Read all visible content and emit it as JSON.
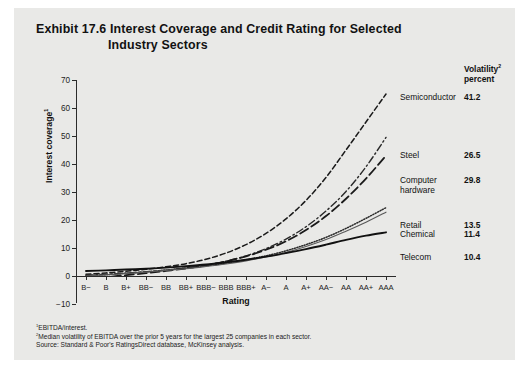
{
  "exhibit": {
    "title_line1": "Exhibit 17.6 Interest Coverage and Credit Rating for Selected",
    "title_line2": "Industry Sectors",
    "panel_color": "#e9e9e7"
  },
  "volatility_header": {
    "line1": "Volatility",
    "line1_sup": "2",
    "line2": "percent"
  },
  "footnotes": {
    "note1_sup": "1",
    "note1": "EBITDA/interest.",
    "note2_sup": "2",
    "note2": "Median volatility of EBITDA over the prior 5 years for the largest 25 companies in each sector.",
    "source": "Source: Standard & Poor's RatingsDirect database, McKinsey analysis."
  },
  "chart_data": {
    "type": "line",
    "title": "Exhibit 17.6 Interest Coverage and Credit Rating for Selected Industry Sectors",
    "xlabel": "Rating",
    "ylabel": "Interest coverage",
    "ylabel_sup": "1",
    "grid": false,
    "legend_position": "right-end-labels",
    "categories": [
      "B-",
      "B",
      "B+",
      "BB-",
      "BB",
      "BB+",
      "BBB-",
      "BBB",
      "BBB+",
      "A-",
      "A",
      "A+",
      "AA-",
      "AA",
      "AA+",
      "AAA"
    ],
    "ylim": [
      -10,
      70
    ],
    "yticks": [
      70,
      60,
      50,
      40,
      30,
      20,
      10,
      0,
      -10
    ],
    "series": [
      {
        "name": "Semiconductor",
        "volatility_percent": "41.2",
        "style": "dashed",
        "color": "#1a1a1a",
        "width": 1.5,
        "dash": "5,3",
        "values": [
          0.6,
          1.1,
          1.7,
          2.4,
          3.3,
          4.4,
          6.0,
          8.2,
          11.2,
          15.2,
          20.4,
          27.0,
          35.2,
          45.0,
          55.0,
          65.0
        ]
      },
      {
        "name": "Steel",
        "volatility_percent": "26.5",
        "style": "dash-dot",
        "color": "#2a2a2a",
        "width": 1.4,
        "dash": "7,3,1.5,3",
        "values": [
          0.3,
          0.6,
          1.0,
          1.5,
          2.1,
          2.9,
          3.9,
          5.3,
          7.2,
          9.8,
          13.2,
          17.6,
          23.2,
          30.2,
          39.0,
          49.5
        ]
      },
      {
        "name": "Computer hardware",
        "volatility_percent": "29.8",
        "style": "long-dashed",
        "color": "#1a1a1a",
        "width": 1.8,
        "dash": "9,4",
        "values": [
          -1.2,
          -0.4,
          0.3,
          1.0,
          1.8,
          2.7,
          3.8,
          5.2,
          7.0,
          9.4,
          12.4,
          16.4,
          21.4,
          27.6,
          34.8,
          43.0
        ]
      },
      {
        "name": "Retail",
        "volatility_percent": "13.5",
        "style": "dotted",
        "color": "#2a2a2a",
        "width": 1.5,
        "dash": "1,1.6",
        "values": [
          0.1,
          0.5,
          1.0,
          1.5,
          2.1,
          2.8,
          3.6,
          4.6,
          5.8,
          7.2,
          9.0,
          11.2,
          13.8,
          17.0,
          20.6,
          24.4
        ]
      },
      {
        "name": "Chemical",
        "volatility_percent": "11.4",
        "style": "thin-solid",
        "color": "#5a5a5a",
        "width": 1.1,
        "dash": "",
        "values": [
          0.0,
          0.4,
          0.9,
          1.4,
          2.0,
          2.6,
          3.4,
          4.3,
          5.4,
          6.8,
          8.4,
          10.5,
          13.0,
          16.0,
          19.2,
          22.8
        ]
      },
      {
        "name": "Telecom",
        "volatility_percent": "10.4",
        "style": "solid",
        "color": "#111111",
        "width": 1.9,
        "dash": "",
        "values": [
          1.8,
          2.0,
          2.3,
          2.6,
          3.0,
          3.5,
          4.1,
          4.9,
          5.8,
          6.9,
          8.2,
          9.6,
          11.2,
          12.9,
          14.4,
          15.6
        ]
      }
    ],
    "series_label_lines": {
      "Computer hardware": [
        "Computer",
        "hardware"
      ]
    }
  }
}
